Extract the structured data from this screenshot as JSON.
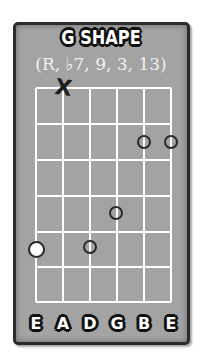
{
  "chord": {
    "title": "G SHAPE",
    "formula": "(R, ♭7, 9, 3, 13)"
  },
  "fretboard": {
    "strings": 6,
    "frets": 6,
    "line_color": "#ffffff",
    "board_color": "#a3a3a3",
    "muted_strings": [
      1
    ],
    "muted_symbol": "X",
    "notes": [
      {
        "string": 5,
        "fret": 1,
        "type": "hollow"
      },
      {
        "string": 6,
        "fret": 1,
        "type": "hollow"
      },
      {
        "string": 4,
        "fret": 3,
        "type": "hollow"
      },
      {
        "string": 1,
        "fret": 4,
        "type": "root-white"
      },
      {
        "string": 3,
        "fret": 4,
        "type": "hollow"
      }
    ]
  },
  "string_labels": [
    "E",
    "A",
    "D",
    "G",
    "B",
    "E"
  ]
}
